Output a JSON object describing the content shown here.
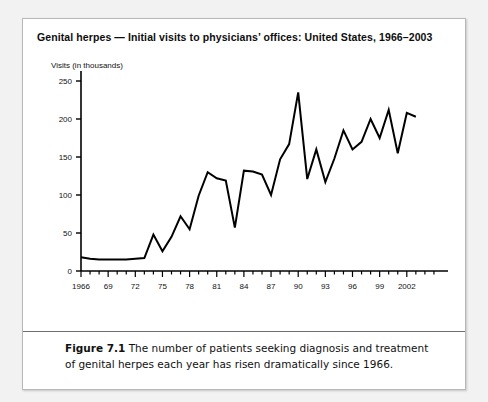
{
  "figure": {
    "title": "Genital herpes  — Initial visits to physicians’ offices: United States, 1966–2003",
    "caption_label": "Figure 7.1",
    "caption_text": " The number of patients seeking diagnosis and treatment of genital herpes each year has risen dramatically since 1966."
  },
  "chart_data": {
    "type": "line",
    "title": "Genital herpes  — Initial visits to physicians’ offices: United States, 1966–2003",
    "xlabel": "",
    "ylabel": "Visits (in thousands)",
    "ylim": [
      0,
      250
    ],
    "xlim": [
      1966,
      2003
    ],
    "yticks": [
      0,
      50,
      100,
      150,
      200,
      250
    ],
    "xticks": [
      1966,
      1969,
      1972,
      1975,
      1978,
      1981,
      1984,
      1987,
      1990,
      1993,
      1996,
      1999,
      2002
    ],
    "xticklabels": [
      "1966",
      "69",
      "72",
      "75",
      "78",
      "81",
      "84",
      "87",
      "90",
      "93",
      "96",
      "99",
      "2002"
    ],
    "grid": false,
    "legend": false,
    "line_color": "#000000",
    "x": [
      1966,
      1967,
      1968,
      1969,
      1970,
      1971,
      1972,
      1973,
      1974,
      1975,
      1976,
      1977,
      1978,
      1979,
      1980,
      1981,
      1982,
      1983,
      1984,
      1985,
      1986,
      1987,
      1988,
      1989,
      1990,
      1991,
      1992,
      1993,
      1994,
      1995,
      1996,
      1997,
      1998,
      1999,
      2000,
      2001,
      2002,
      2003
    ],
    "values": [
      18,
      16,
      15,
      15,
      15,
      15,
      16,
      17,
      48,
      26,
      45,
      72,
      55,
      99,
      130,
      122,
      119,
      57,
      132,
      131,
      127,
      100,
      147,
      167,
      235,
      121,
      160,
      117,
      148,
      185,
      160,
      170,
      200,
      175,
      212,
      155,
      208,
      203
    ],
    "series": [
      {
        "name": "Initial visits to physicians’ offices",
        "values": [
          18,
          16,
          15,
          15,
          15,
          15,
          16,
          17,
          48,
          26,
          45,
          72,
          55,
          99,
          130,
          122,
          119,
          57,
          132,
          131,
          127,
          100,
          147,
          167,
          235,
          121,
          160,
          117,
          148,
          185,
          160,
          170,
          200,
          175,
          212,
          155,
          208,
          203
        ]
      }
    ]
  }
}
